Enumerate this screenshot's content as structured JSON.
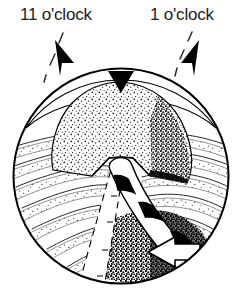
{
  "figure": {
    "background_color": "#ffffff",
    "ink_color": "#000000",
    "text_color": "#1d1d1d",
    "width": 242,
    "height": 298
  },
  "labels": {
    "left": {
      "text": "11 o'clock",
      "name": "clock-position-11-label"
    },
    "right": {
      "text": "1 o'clock",
      "name": "clock-position-1-label"
    }
  },
  "pointers": [
    {
      "name": "leader-arrow-11-oclock",
      "direction": "up-left",
      "style": "solid-triangle-with-dashed-leader"
    },
    {
      "name": "leader-arrow-1-oclock",
      "direction": "up-right",
      "style": "solid-triangle-with-dashed-leader"
    }
  ],
  "scope_field": {
    "name": "arthroscopic-circular-field",
    "shape": "circle",
    "center_x": 121,
    "center_y": 176,
    "radius": 108
  },
  "anatomy": [
    {
      "name": "apex-marker-triangle",
      "description": "Solid black downward triangle at the 12 o'clock rim",
      "position": "top-center"
    },
    {
      "name": "stippled-dome-structure",
      "description": "Large central stippled dome (notch roof)",
      "fill": "stipple"
    },
    {
      "name": "radial-striations-left",
      "description": "Stippled radial striation bands fanning to the left rim"
    },
    {
      "name": "radial-striations-right",
      "description": "Stippled radial striation bands fanning to the right rim"
    },
    {
      "name": "dark-stippled-floor",
      "description": "Dense dark stipple region at lower center-right"
    }
  ],
  "graft_bands": [
    {
      "name": "banded-graft-strand",
      "description": "White curved band with black cross-bands running from the notch down to the lower right",
      "style": "white-fill-black-crossbands"
    },
    {
      "name": "dashed-projected-strand",
      "description": "Dashed-outline band projecting down and to the left (hidden path)",
      "style": "dashed-outline"
    }
  ],
  "direction_arrow": {
    "name": "direction-arrow-left",
    "description": "White block arrow pointing left, outlined in black",
    "direction": "left"
  }
}
